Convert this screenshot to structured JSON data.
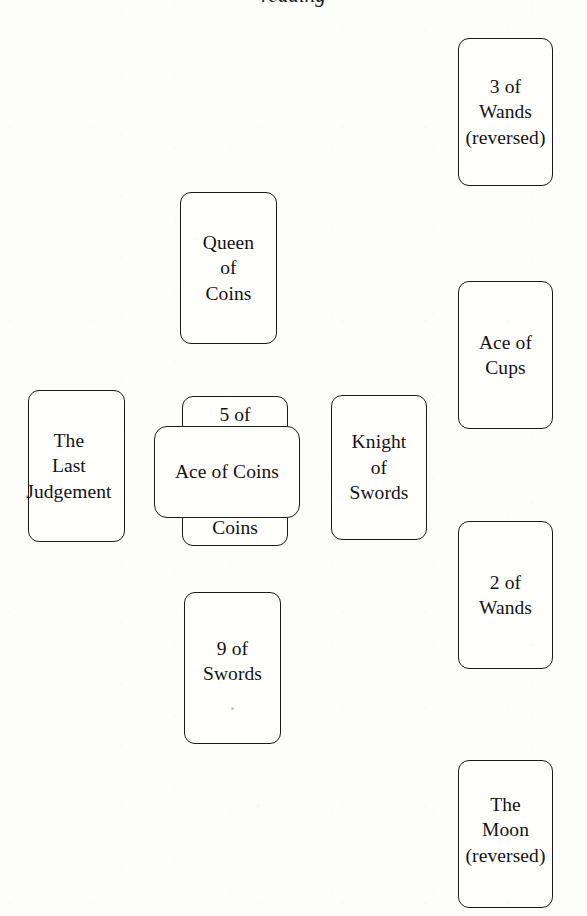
{
  "page": {
    "background_color": "#fdfdfc",
    "ink_color": "#1a1a1a",
    "cropped_heading_remnant": "reading"
  },
  "spread": {
    "name": "Celtic Cross",
    "card_count": 10,
    "cards": [
      {
        "position": 1,
        "role": "significator",
        "name": "5 of Coins",
        "label_top": "5 of",
        "label_bottom": "Coins",
        "orientation": "upright",
        "layout": "vertical",
        "covered_by": "Ace of Coins",
        "x": 182,
        "y": 396,
        "w": 106,
        "h": 150
      },
      {
        "position": 2,
        "role": "crossing",
        "name": "Ace of Coins",
        "label": "Ace of Coins",
        "orientation": "upright",
        "layout": "horizontal",
        "x": 154,
        "y": 426,
        "w": 146,
        "h": 92
      },
      {
        "position": 3,
        "role": "crown",
        "name": "Queen of Coins",
        "label": "Queen\nof\nCoins",
        "orientation": "upright",
        "layout": "vertical",
        "x": 180,
        "y": 192,
        "w": 97,
        "h": 152
      },
      {
        "position": 4,
        "role": "foundation",
        "name": "9 of Swords",
        "label": "9 of\nSwords",
        "orientation": "upright",
        "layout": "vertical",
        "x": 184,
        "y": 592,
        "w": 97,
        "h": 152
      },
      {
        "position": 5,
        "role": "past",
        "name": "The Last Judgement",
        "label": "The\nLast\nJudgement",
        "orientation": "upright",
        "layout": "vertical",
        "x": 28,
        "y": 390,
        "w": 97,
        "h": 152
      },
      {
        "position": 6,
        "role": "future",
        "name": "Knight of Swords",
        "label": "Knight\nof\nSwords",
        "orientation": "upright",
        "layout": "vertical",
        "x": 331,
        "y": 395,
        "w": 96,
        "h": 145
      },
      {
        "position": 7,
        "role": "staff-bottom",
        "name": "The Moon (reversed)",
        "label": "The\nMoon\n(reversed)",
        "orientation": "reversed",
        "layout": "vertical",
        "x": 458,
        "y": 760,
        "w": 95,
        "h": 148
      },
      {
        "position": 8,
        "role": "staff-lower-middle",
        "name": "2 of Wands",
        "label": "2 of\nWands",
        "orientation": "upright",
        "layout": "vertical",
        "x": 458,
        "y": 521,
        "w": 95,
        "h": 148
      },
      {
        "position": 9,
        "role": "staff-upper-middle",
        "name": "Ace of Cups",
        "label": "Ace of\nCups",
        "orientation": "upright",
        "layout": "vertical",
        "x": 458,
        "y": 281,
        "w": 95,
        "h": 148
      },
      {
        "position": 10,
        "role": "staff-top",
        "name": "3 of Wands (reversed)",
        "label": "3 of\nWands\n(reversed)",
        "orientation": "reversed",
        "layout": "vertical",
        "x": 458,
        "y": 38,
        "w": 95,
        "h": 148
      }
    ]
  }
}
